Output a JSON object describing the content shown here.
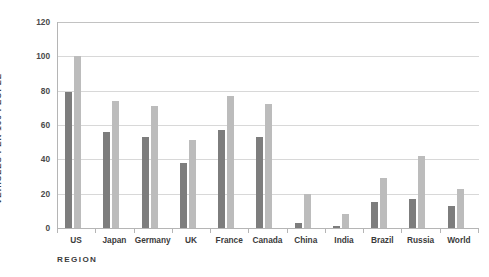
{
  "chart_data": {
    "type": "bar",
    "title": "",
    "xlabel": "REGION",
    "ylabel": "VEHICLES PER 100 PEOPLE",
    "ylim": [
      0,
      120
    ],
    "yticks": [
      0,
      20,
      40,
      60,
      80,
      100,
      120
    ],
    "grid": true,
    "legend": "none",
    "categories": [
      "US",
      "Japan",
      "Germany",
      "UK",
      "France",
      "Canada",
      "China",
      "India",
      "Brazil",
      "Russia",
      "World"
    ],
    "series": [
      {
        "name": "series-dark",
        "color": "#7d7d7d",
        "values": [
          79,
          56,
          53,
          38,
          57,
          53,
          3,
          1,
          15,
          17,
          13
        ]
      },
      {
        "name": "series-light",
        "color": "#bcbcbc",
        "values": [
          100,
          74,
          71,
          51,
          77,
          72,
          20,
          8,
          29,
          42,
          23
        ]
      }
    ]
  },
  "colors": {
    "series_dark": "#7d7d7d",
    "series_light": "#bcbcbc",
    "gridline": "#d8d8d8",
    "axis": "#b5b5b5",
    "text": "#3b3b3b",
    "background": "#ffffff"
  }
}
